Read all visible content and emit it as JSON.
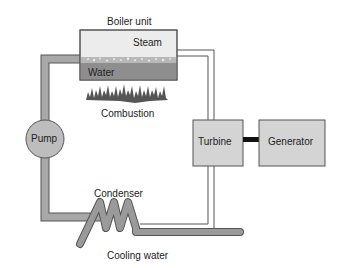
{
  "diagram": {
    "type": "steam power plant cycle",
    "labels": {
      "boiler_unit": "Boiler unit",
      "steam": "Steam",
      "water": "Water",
      "combustion": "Combustion",
      "pump": "Pump",
      "turbine": "Turbine",
      "generator": "Generator",
      "condenser": "Condenser",
      "cooling_water": "Cooling water"
    },
    "colors": {
      "pipe_fill": "#a8a8a8",
      "pipe_stroke": "#555555",
      "water": "#8e8e8e",
      "steam_area": "#ececec",
      "flame": "#555555",
      "box_fill": "#d4d4d4",
      "coupling": "#111111"
    },
    "components": [
      {
        "id": "boiler",
        "label": "Boiler unit",
        "contains": [
          "Steam",
          "Water"
        ]
      },
      {
        "id": "combustion",
        "label": "Combustion"
      },
      {
        "id": "pump",
        "label": "Pump"
      },
      {
        "id": "turbine",
        "label": "Turbine"
      },
      {
        "id": "generator",
        "label": "Generator"
      },
      {
        "id": "condenser",
        "label": "Condenser"
      },
      {
        "id": "cooling-water",
        "label": "Cooling water"
      }
    ],
    "connections": [
      {
        "from": "boiler",
        "to": "turbine",
        "via": "steam line"
      },
      {
        "from": "turbine",
        "to": "generator",
        "via": "shaft"
      },
      {
        "from": "turbine",
        "to": "condenser",
        "via": "exhaust line"
      },
      {
        "from": "condenser",
        "to": "pump",
        "via": "water return"
      },
      {
        "from": "pump",
        "to": "boiler",
        "via": "feed water"
      }
    ]
  }
}
